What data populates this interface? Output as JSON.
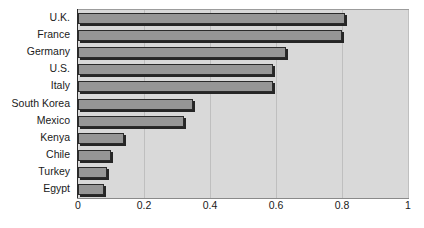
{
  "chart_data": {
    "type": "bar",
    "orientation": "horizontal",
    "title": "",
    "subtitle": "",
    "xlabel": "",
    "ylabel": "",
    "categories": [
      "U.K.",
      "France",
      "Germany",
      "U.S.",
      "Italy",
      "South Korea",
      "Mexico",
      "Kenya",
      "Chile",
      "Turkey",
      "Egypt"
    ],
    "values": [
      0.81,
      0.8,
      0.63,
      0.59,
      0.59,
      0.35,
      0.32,
      0.14,
      0.1,
      0.088,
      0.078
    ],
    "xlim": [
      0,
      1
    ],
    "xticks": [
      0,
      0.2,
      0.4,
      0.6,
      0.8,
      1
    ],
    "xtick_labels": [
      "0",
      "0.2",
      "0.4",
      "0.6",
      "0.8",
      "1"
    ],
    "grid": "vertical",
    "legend": "none",
    "bar_color": "#969696",
    "bar_border_color": "#2b2b2b",
    "plot_background": "#d9d9d9",
    "gridline_color": "#bfbfbf",
    "page_background": "#ffffff"
  }
}
